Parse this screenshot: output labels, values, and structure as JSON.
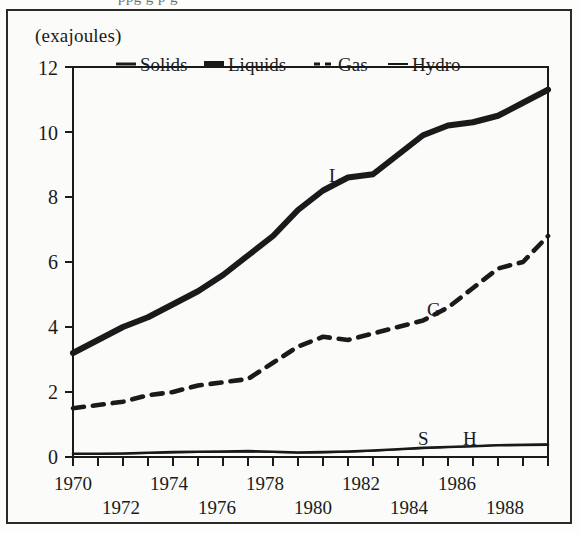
{
  "figure": {
    "partial_text_above": "ppg g p g",
    "unit_label": "(exajoules)"
  },
  "legend": {
    "items": [
      {
        "label": "Solids",
        "style": "solid-medium"
      },
      {
        "label": "Liquids",
        "style": "solid-thick"
      },
      {
        "label": "Gas",
        "style": "dashed"
      },
      {
        "label": "Hydro",
        "style": "solid-thin"
      }
    ]
  },
  "annotations": [
    {
      "text": "L",
      "series": "Liquids"
    },
    {
      "text": "G",
      "series": "Gas"
    },
    {
      "text": "S",
      "series": "Solids"
    },
    {
      "text": "H",
      "series": "Hydro"
    }
  ],
  "chart_data": {
    "type": "line",
    "title": "",
    "subtitle": "",
    "xlabel": "",
    "ylabel": "(exajoules)",
    "xlim": [
      1970,
      1989
    ],
    "ylim": [
      0,
      12
    ],
    "yticks": [
      0,
      2,
      4,
      6,
      8,
      10,
      12
    ],
    "ytick_labels": [
      "0",
      "2",
      "4",
      "6",
      "8",
      "10",
      "12"
    ],
    "xticks": [
      1970,
      1971,
      1972,
      1973,
      1974,
      1975,
      1976,
      1977,
      1978,
      1979,
      1980,
      1981,
      1982,
      1983,
      1984,
      1985,
      1986,
      1987,
      1988,
      1989
    ],
    "xtick_labels_upper": [
      "1970",
      "1974",
      "1978",
      "1982",
      "1986"
    ],
    "xtick_labels_lower": [
      "1972",
      "1976",
      "1980",
      "1984",
      "1988"
    ],
    "grid": false,
    "legend_position": "top-inside",
    "x": [
      1970,
      1971,
      1972,
      1973,
      1974,
      1975,
      1976,
      1977,
      1978,
      1979,
      1980,
      1981,
      1982,
      1983,
      1984,
      1985,
      1986,
      1987,
      1988,
      1989
    ],
    "series": [
      {
        "name": "Liquids",
        "marker_label": "L",
        "values": [
          3.2,
          3.6,
          4.0,
          4.3,
          4.7,
          5.1,
          5.6,
          6.2,
          6.8,
          7.6,
          8.2,
          8.6,
          8.7,
          9.3,
          9.9,
          10.2,
          10.3,
          10.5,
          10.9,
          11.3
        ]
      },
      {
        "name": "Gas",
        "marker_label": "G",
        "values": [
          1.5,
          1.6,
          1.7,
          1.9,
          2.0,
          2.2,
          2.3,
          2.4,
          2.9,
          3.4,
          3.7,
          3.6,
          3.8,
          4.0,
          4.2,
          4.6,
          5.2,
          5.8,
          6.0,
          6.8
        ]
      },
      {
        "name": "Solids",
        "marker_label": "S",
        "values": [
          0.1,
          0.1,
          0.11,
          0.13,
          0.15,
          0.16,
          0.17,
          0.18,
          0.16,
          0.14,
          0.15,
          0.17,
          0.2,
          0.24,
          0.28,
          0.31,
          0.33,
          0.36,
          0.37,
          0.38
        ]
      },
      {
        "name": "Hydro",
        "marker_label": "H",
        "values": [
          0.09,
          0.09,
          0.1,
          0.12,
          0.14,
          0.15,
          0.16,
          0.17,
          0.15,
          0.13,
          0.14,
          0.16,
          0.19,
          0.23,
          0.27,
          0.3,
          0.33,
          0.37,
          0.38,
          0.39
        ]
      }
    ]
  },
  "colors": {
    "ink": "#1a1a1a",
    "frame": "#2a2a2a",
    "paper": "#fbfbf9"
  }
}
